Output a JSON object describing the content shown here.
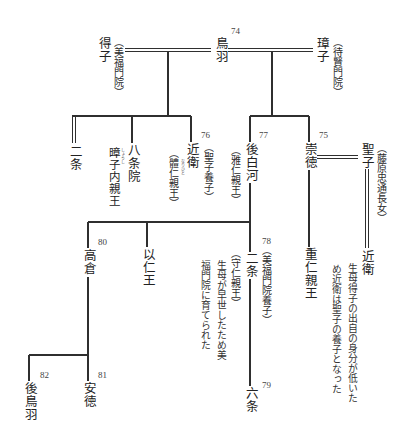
{
  "diagram": {
    "persons": {
      "toba": {
        "name": "鳥羽",
        "number": "74"
      },
      "tokushi": {
        "name": "得子",
        "title": "（美福門院）"
      },
      "shoshi": {
        "name": "璋子",
        "title": "（待賢門院）"
      },
      "nijo_top": {
        "name": "二条"
      },
      "hachijoin": {
        "name": "八条院",
        "personal_name": "暲子内親王",
        "ruby": "しょうし"
      },
      "konoe": {
        "name": "近衛",
        "number": "76",
        "title": "（聖子養子）",
        "personal_name": "（體仁親王）",
        "ruby": "なりひと"
      },
      "goshirakawa": {
        "name": "後白河",
        "number": "77",
        "personal_name": "（雅仁親王）"
      },
      "sutoku": {
        "name": "崇徳",
        "number": "75"
      },
      "seishi": {
        "name": "聖子",
        "title": "（藤原忠通長女）"
      },
      "konoe_adopted": {
        "name": "近衛"
      },
      "shigehito": {
        "name": "重仁親王"
      },
      "takakura": {
        "name": "高倉",
        "number": "80"
      },
      "mochihito": {
        "name": "以仁王"
      },
      "nijo": {
        "name": "二条",
        "number": "78",
        "title": "（美福門院養子）",
        "personal_name": "（守仁親王）"
      },
      "rokujo": {
        "name": "六条",
        "number": "79"
      },
      "antoku": {
        "name": "安徳",
        "number": "81"
      },
      "gotoba": {
        "name": "後鳥羽",
        "number": "82"
      }
    },
    "notes": {
      "konoe_adoption": [
        "生母得子の出自の身分が低いた",
        "め近衛は聖子の養子となった"
      ],
      "nijo_upbringing": [
        "生母が早世したため美",
        "福門院に育てられた"
      ]
    },
    "links": [
      {
        "from": "得子",
        "to": "鳥羽",
        "line": "double-horizontal"
      },
      {
        "from": "鳥羽",
        "to": "璋子",
        "line": "double-horizontal"
      },
      {
        "from": "鳥羽・得子",
        "to": "二条",
        "line": "double-vertical"
      },
      {
        "from": "鳥羽・得子",
        "to": "八条院",
        "line": "single"
      },
      {
        "from": "鳥羽・得子",
        "to": "近衛",
        "line": "single"
      },
      {
        "from": "鳥羽・璋子",
        "to": "後白河",
        "line": "single"
      },
      {
        "from": "鳥羽・璋子",
        "to": "崇徳",
        "line": "single"
      },
      {
        "from": "崇徳",
        "to": "聖子",
        "line": "double-horizontal"
      },
      {
        "from": "聖子",
        "to": "近衛",
        "line": "double-vertical"
      },
      {
        "from": "崇徳",
        "to": "重仁親王",
        "line": "single"
      },
      {
        "from": "後白河",
        "to": "高倉",
        "line": "single"
      },
      {
        "from": "後白河",
        "to": "以仁王",
        "line": "single"
      },
      {
        "from": "後白河",
        "to": "二条",
        "line": "single"
      },
      {
        "from": "二条",
        "to": "六条",
        "line": "single"
      },
      {
        "from": "高倉",
        "to": "安徳",
        "line": "single"
      },
      {
        "from": "高倉",
        "to": "後鳥羽",
        "line": "single"
      }
    ]
  }
}
